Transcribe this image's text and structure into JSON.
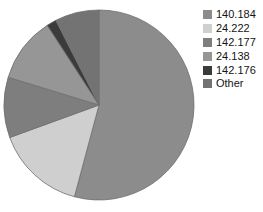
{
  "chart_data": {
    "type": "pie",
    "title": "",
    "subtitle": "",
    "xlabel": "",
    "ylabel": "",
    "legend_position": "right",
    "grid": false,
    "categories": [
      "140.184",
      "24.222",
      "142.177",
      "24.138",
      "142.176",
      "Other"
    ],
    "values": [
      54.2,
      15.3,
      10.3,
      11.1,
      1.7,
      7.5
    ],
    "units": "percent",
    "slices": [
      {
        "label": "140.184",
        "value": 54.2,
        "start_angle_deg": 0,
        "end_angle_deg": 195,
        "color": "#8c8c8c"
      },
      {
        "label": "24.222",
        "value": 15.3,
        "start_angle_deg": 195,
        "end_angle_deg": 250,
        "color": "#cfcfcf"
      },
      {
        "label": "142.177",
        "value": 10.3,
        "start_angle_deg": 250,
        "end_angle_deg": 287,
        "color": "#7e7e7e"
      },
      {
        "label": "24.138",
        "value": 11.1,
        "start_angle_deg": 287,
        "end_angle_deg": 327,
        "color": "#969696"
      },
      {
        "label": "142.176",
        "value": 1.7,
        "start_angle_deg": 327,
        "end_angle_deg": 333,
        "color": "#3b3b3b"
      },
      {
        "label": "Other",
        "value": 7.5,
        "start_angle_deg": 333,
        "end_angle_deg": 360,
        "color": "#737373"
      }
    ],
    "geometry": {
      "center_x": 99,
      "center_y": 105,
      "radius": 95
    }
  },
  "legend": {
    "items": [
      {
        "label": "140.184",
        "color": "#8c8c8c"
      },
      {
        "label": "24.222",
        "color": "#cfcfcf"
      },
      {
        "label": "142.177",
        "color": "#7e7e7e"
      },
      {
        "label": "24.138",
        "color": "#969696"
      },
      {
        "label": "142.176",
        "color": "#3b3b3b"
      },
      {
        "label": "Other",
        "color": "#737373"
      }
    ]
  },
  "colors": {
    "background": "#ffffff",
    "slice_border": "#6e6e6e",
    "text": "#141414"
  }
}
